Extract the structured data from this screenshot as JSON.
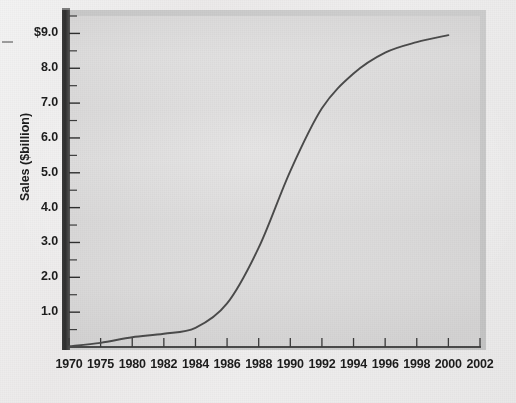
{
  "figure": {
    "background_color": "#efeeee",
    "plot_background_color": "#dcdbdb",
    "axis_color": "#2e2e2e",
    "series_color": "#4b4b4b"
  },
  "chart_data": {
    "type": "line",
    "title": "",
    "xlabel": "",
    "ylabel": "Sales ($billion)",
    "grid": false,
    "legend": null,
    "ylim": [
      0,
      9.5
    ],
    "y_ticks": [
      1.0,
      2.0,
      3.0,
      4.0,
      5.0,
      6.0,
      7.0,
      8.0,
      9.0
    ],
    "y_tick_labels": [
      "1.0",
      "2.0",
      "3.0",
      "4.0",
      "5.0",
      "6.0",
      "7.0",
      "8.0",
      "$9.0"
    ],
    "y_minor_tick_step": 0.5,
    "x_axis_note": "Category-style axis: ticks evenly spaced despite uneven year gaps",
    "categories": [
      "1970",
      "1975",
      "1980",
      "1982",
      "1984",
      "1986",
      "1988",
      "1990",
      "1992",
      "1994",
      "1996",
      "1998",
      "2000",
      "2002"
    ],
    "series": [
      {
        "name": "Sales",
        "values": [
          0.02,
          0.12,
          0.28,
          0.38,
          0.55,
          1.25,
          2.85,
          5.05,
          6.85,
          7.85,
          8.45,
          8.75,
          8.95,
          null
        ]
      }
    ]
  },
  "annotations": {
    "scan_artifact": "stray-tick-mark-left-margin"
  }
}
